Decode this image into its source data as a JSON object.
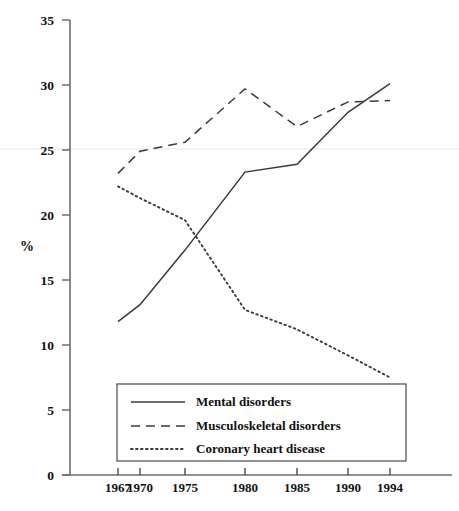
{
  "chart_data": {
    "type": "line",
    "title": "",
    "xlabel": "",
    "ylabel": "%",
    "x": [
      1967,
      1970,
      1975,
      1980,
      1985,
      1990,
      1994
    ],
    "xtick_labels": [
      "1967",
      "1970",
      "1975",
      "1980",
      "1985",
      "1990",
      "1994"
    ],
    "ytick_labels": [
      "0",
      "5",
      "10",
      "15",
      "20",
      "25",
      "30",
      "35"
    ],
    "ytick_values": [
      0,
      5,
      10,
      15,
      20,
      25,
      30,
      35
    ],
    "ylim": [
      0,
      35
    ],
    "grid": false,
    "legend_position": "bottom-center",
    "series": [
      {
        "name": "Mental disorders",
        "style": "solid",
        "color": "#3a3a3a",
        "values": [
          11.8,
          13.1,
          17.3,
          23.3,
          23.9,
          27.9,
          30.1
        ]
      },
      {
        "name": "Musculoskeletal disorders",
        "style": "dashed",
        "color": "#3a3a3a",
        "values": [
          23.2,
          24.9,
          25.6,
          29.7,
          26.8,
          28.7,
          28.8
        ]
      },
      {
        "name": "Coronary heart disease",
        "style": "dotted",
        "color": "#3a3a3a",
        "values": [
          22.2,
          21.3,
          19.6,
          12.7,
          11.2,
          9.2,
          7.5
        ]
      }
    ]
  },
  "axis": {
    "y_title": "%"
  },
  "legend": {
    "items": [
      {
        "label": "Mental disorders",
        "style": "solid"
      },
      {
        "label": "Musculoskeletal disorders",
        "style": "dashed"
      },
      {
        "label": "Coronary heart disease",
        "style": "dotted"
      }
    ]
  },
  "ticks": {
    "y": [
      "35",
      "30",
      "25",
      "20",
      "15",
      "10",
      "5",
      "0"
    ],
    "x": [
      "1967",
      "1970",
      "1975",
      "1980",
      "1985",
      "1990",
      "1994"
    ]
  }
}
